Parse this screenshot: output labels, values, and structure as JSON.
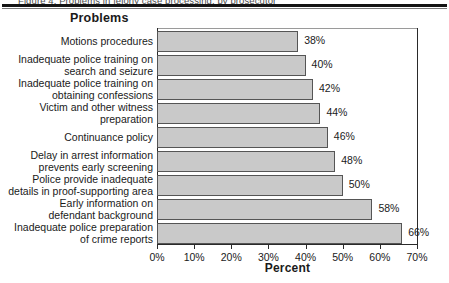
{
  "page": {
    "clipped_caption": "Figure 4. Problems in felony case processing, by prosecutor",
    "title": "Problems"
  },
  "chart_data": {
    "type": "bar",
    "orientation": "horizontal",
    "title": "Problems",
    "xlabel": "Percent",
    "ylabel": "",
    "xlim": [
      0,
      70
    ],
    "grid": false,
    "legend": null,
    "categories": [
      "Motions procedures",
      "Inadequate police training on\nsearch and seizure",
      "Inadequate police training on\nobtaining confessions",
      "Victim and other witness\npreparation",
      "Continuance policy",
      "Delay in arrest information\nprevents early screening",
      "Police provide inadequate\ndetails in proof-supporting area",
      "Early information on\ndefendant background",
      "Inadequate police preparation\nof crime reports"
    ],
    "values": [
      38,
      40,
      42,
      44,
      46,
      48,
      50,
      58,
      66
    ],
    "value_labels": [
      "38%",
      "40%",
      "42%",
      "44%",
      "46%",
      "48%",
      "50%",
      "58%",
      "66%"
    ],
    "xticks": [
      0,
      10,
      20,
      30,
      40,
      50,
      60,
      70
    ],
    "xtick_labels": [
      "0%",
      "10%",
      "20%",
      "30%",
      "40%",
      "50%",
      "60%",
      "70%"
    ],
    "bar_color": "#c9c9c9",
    "bar_edge_color": "#555555"
  }
}
